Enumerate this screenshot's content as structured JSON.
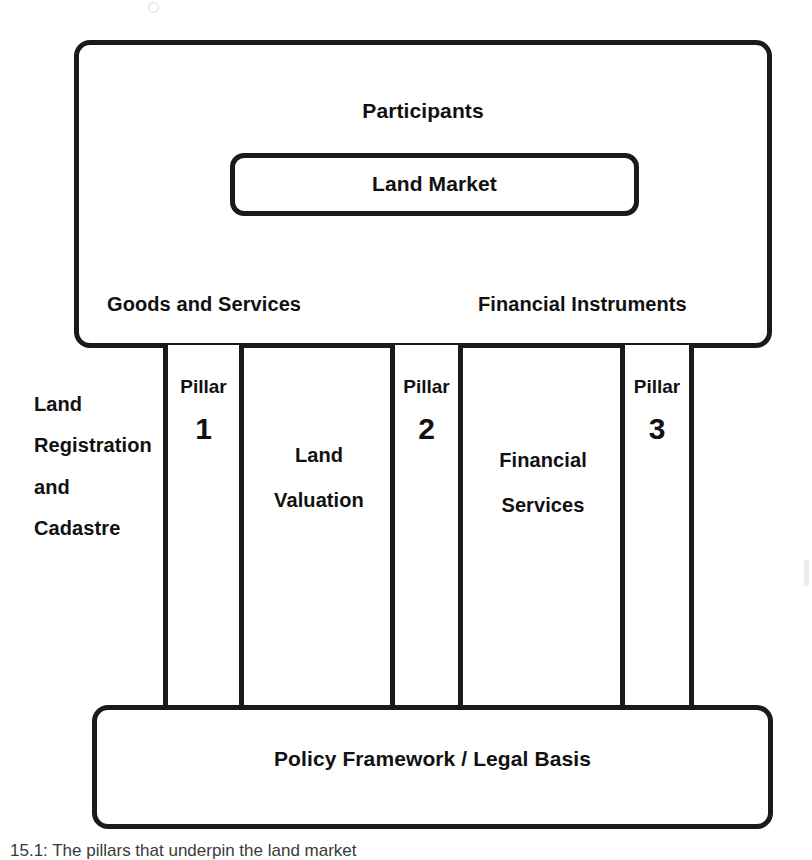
{
  "figure": {
    "caption": "15.1: The pillars that underpin the land market"
  },
  "top_frame": {
    "participants_label": "Participants",
    "land_market_label": "Land Market",
    "goods_and_services_label": "Goods and Services",
    "financial_instruments_label": "Financial Instruments"
  },
  "pillars": [
    {
      "word": "Pillar",
      "number": "1",
      "side_label": "Land\nRegistration\nand\nCadastre"
    },
    {
      "word": "Pillar",
      "number": "2",
      "side_label": "Land\nValuation"
    },
    {
      "word": "Pillar",
      "number": "3",
      "side_label": "Financial\nServices"
    }
  ],
  "foundation": {
    "label": "Policy Framework / Legal Basis"
  },
  "colors": {
    "stroke": "#1a1a1a",
    "background": "#ffffff",
    "text": "#111111"
  }
}
